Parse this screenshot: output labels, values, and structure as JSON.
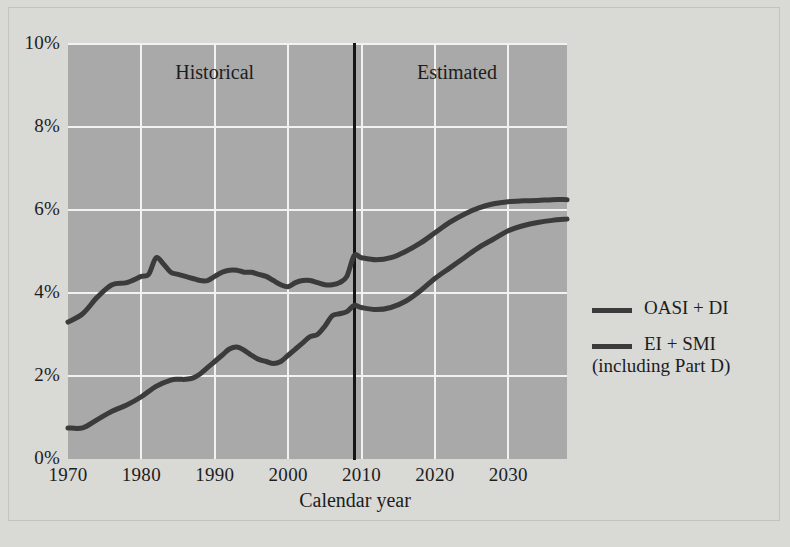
{
  "chart_data": {
    "type": "line",
    "title": "",
    "xlabel": "Calendar year",
    "ylabel": "",
    "xlim": [
      1970,
      2038
    ],
    "ylim": [
      0,
      10
    ],
    "y_unit": "%",
    "grid": true,
    "legend_position": "right",
    "x_ticks": [
      "1970",
      "1980",
      "1990",
      "2000",
      "2010",
      "2020",
      "2030"
    ],
    "x_tick_values": [
      1970,
      1980,
      1990,
      2000,
      2010,
      2020,
      2030
    ],
    "y_ticks": [
      "0%",
      "2%",
      "4%",
      "6%",
      "8%",
      "10%"
    ],
    "y_tick_values": [
      0,
      2,
      4,
      6,
      8,
      10
    ],
    "annotations": [
      {
        "text": "Historical",
        "x": 1990,
        "y": 9.3
      },
      {
        "text": "Estimated",
        "x": 2023,
        "y": 9.3
      }
    ],
    "divider_year": 2009,
    "series": [
      {
        "name": "OASI + DI",
        "color": "#3b3b3b",
        "x": [
          1970,
          1972,
          1974,
          1976,
          1978,
          1980,
          1981,
          1982,
          1983,
          1984,
          1985,
          1986,
          1987,
          1988,
          1989,
          1990,
          1991,
          1992,
          1993,
          1994,
          1995,
          1996,
          1997,
          1998,
          1999,
          2000,
          2001,
          2002,
          2003,
          2004,
          2005,
          2006,
          2007,
          2008,
          2009,
          2010,
          2012,
          2014,
          2016,
          2018,
          2020,
          2022,
          2024,
          2026,
          2028,
          2030,
          2032,
          2034,
          2036,
          2038
        ],
        "values": [
          3.3,
          3.5,
          3.9,
          4.2,
          4.25,
          4.4,
          4.45,
          4.85,
          4.7,
          4.5,
          4.45,
          4.4,
          4.35,
          4.3,
          4.3,
          4.4,
          4.5,
          4.55,
          4.55,
          4.5,
          4.5,
          4.45,
          4.4,
          4.3,
          4.2,
          4.15,
          4.25,
          4.3,
          4.3,
          4.25,
          4.2,
          4.2,
          4.25,
          4.4,
          4.9,
          4.85,
          4.8,
          4.85,
          5.0,
          5.2,
          5.45,
          5.7,
          5.9,
          6.05,
          6.15,
          6.2,
          6.22,
          6.23,
          6.25,
          6.25
        ]
      },
      {
        "name": "EI + SMI\n(including Part D)",
        "color": "#3b3b3b",
        "x": [
          1970,
          1972,
          1974,
          1976,
          1978,
          1980,
          1982,
          1984,
          1985,
          1986,
          1987,
          1988,
          1989,
          1990,
          1991,
          1992,
          1993,
          1994,
          1995,
          1996,
          1997,
          1998,
          1999,
          2000,
          2001,
          2002,
          2003,
          2004,
          2005,
          2006,
          2007,
          2008,
          2009,
          2010,
          2012,
          2014,
          2016,
          2018,
          2020,
          2022,
          2024,
          2026,
          2028,
          2030,
          2032,
          2034,
          2036,
          2038
        ],
        "values": [
          0.75,
          0.75,
          0.95,
          1.15,
          1.3,
          1.5,
          1.75,
          1.9,
          1.92,
          1.92,
          1.95,
          2.05,
          2.2,
          2.35,
          2.5,
          2.65,
          2.7,
          2.62,
          2.5,
          2.4,
          2.35,
          2.3,
          2.35,
          2.5,
          2.65,
          2.8,
          2.95,
          3.0,
          3.2,
          3.45,
          3.5,
          3.55,
          3.7,
          3.65,
          3.6,
          3.65,
          3.8,
          4.05,
          4.35,
          4.6,
          4.85,
          5.1,
          5.3,
          5.5,
          5.62,
          5.7,
          5.75,
          5.78
        ]
      }
    ]
  },
  "axis": {
    "x_title": "Calendar year"
  },
  "bands": {
    "historical": "Historical",
    "estimated": "Estimated"
  },
  "legend": {
    "items": [
      {
        "label": "OASI + DI",
        "color": "#3b3b3b"
      },
      {
        "label": "EI + SMI\n(including Part D)",
        "color": "#3b3b3b"
      }
    ]
  },
  "colors": {
    "page_background": "#d9d9d6",
    "plot_background": "#a9a9a9",
    "gridline": "#f2f2f2",
    "line": "#3b3b3b",
    "divider": "#151515",
    "text": "#1d1d1d"
  }
}
